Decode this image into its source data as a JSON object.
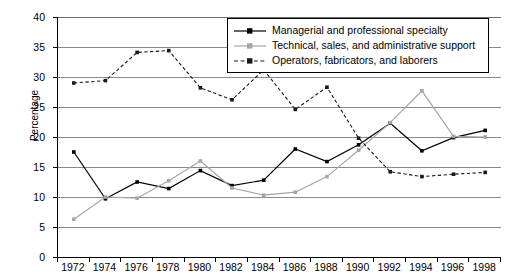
{
  "chart_data": {
    "type": "line",
    "title": "",
    "xlabel": "",
    "ylabel": "Percentage",
    "categories": [
      "1972",
      "1974",
      "1976",
      "1978",
      "1980",
      "1982",
      "1984",
      "1986",
      "1988",
      "1990",
      "1992",
      "1994",
      "1996",
      "1998"
    ],
    "x": [
      1972,
      1974,
      1976,
      1978,
      1980,
      1982,
      1984,
      1986,
      1988,
      1990,
      1992,
      1994,
      1996,
      1998
    ],
    "ylim": [
      0,
      40
    ],
    "yticks": [
      0,
      5,
      10,
      15,
      20,
      25,
      30,
      35,
      40
    ],
    "grid": true,
    "legend_position": "top-right",
    "series": [
      {
        "name": "Managerial and professional specialty",
        "color": "#000000",
        "style": "solid",
        "marker": "square",
        "values": [
          17.5,
          9.7,
          12.5,
          11.4,
          14.4,
          11.9,
          12.8,
          18.0,
          15.9,
          18.7,
          22.3,
          17.7,
          19.9,
          21.1
        ]
      },
      {
        "name": "Technical, sales, and administrative support",
        "color": "#a6a6a6",
        "style": "solid",
        "marker": "square",
        "values": [
          6.3,
          10.0,
          9.8,
          12.7,
          16.0,
          11.5,
          10.3,
          10.8,
          13.4,
          17.8,
          22.4,
          27.7,
          20.1,
          20.0
        ]
      },
      {
        "name": "Operators, fabricators, and laborers",
        "color": "#1a1a1a",
        "style": "dashed",
        "marker": "square",
        "values": [
          29.0,
          29.4,
          34.1,
          34.4,
          28.2,
          26.2,
          31.2,
          24.6,
          28.3,
          19.8,
          14.2,
          13.4,
          13.8,
          14.1
        ]
      }
    ]
  },
  "legend": {
    "items": [
      {
        "label": "Managerial and professional specialty"
      },
      {
        "label": "Technical, sales, and administrative support"
      },
      {
        "label": "Operators, fabricators, and laborers"
      }
    ]
  }
}
